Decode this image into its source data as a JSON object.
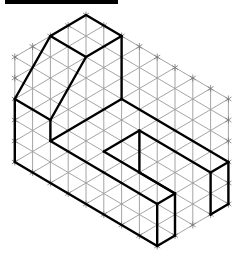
{
  "diagram": {
    "type": "isometric-drawing",
    "title_bar": {
      "color": "#000000"
    },
    "grid": {
      "origin_px": [
        86,
        15
      ],
      "step_x": 17.8,
      "step_y": 10.5,
      "color": "#9a9a9a",
      "boundary": [
        [
          0,
          0
        ],
        [
          8,
          8
        ],
        [
          8,
          18
        ],
        [
          4,
          22
        ],
        [
          -4,
          14
        ],
        [
          -4,
          4
        ]
      ]
    },
    "shape": {
      "color": "#000000",
      "edges": [
        [
          [
            0,
            0
          ],
          [
            2,
            2
          ]
        ],
        [
          [
            0,
            0
          ],
          [
            -2,
            2
          ]
        ],
        [
          [
            -2,
            2
          ],
          [
            0,
            4
          ]
        ],
        [
          [
            0,
            4
          ],
          [
            2,
            2
          ]
        ],
        [
          [
            -2,
            2
          ],
          [
            -4,
            8
          ]
        ],
        [
          [
            0,
            4
          ],
          [
            -2,
            10
          ]
        ],
        [
          [
            -4,
            8
          ],
          [
            -2,
            10
          ]
        ],
        [
          [
            -4,
            8
          ],
          [
            -4,
            14
          ]
        ],
        [
          [
            -2,
            10
          ],
          [
            -2,
            12
          ]
        ],
        [
          [
            -2,
            12
          ],
          [
            2,
            8
          ]
        ],
        [
          [
            2,
            2
          ],
          [
            2,
            8
          ]
        ],
        [
          [
            2,
            8
          ],
          [
            8,
            14
          ]
        ],
        [
          [
            -2,
            12
          ],
          [
            4,
            18
          ]
        ],
        [
          [
            -4,
            14
          ],
          [
            4,
            22
          ]
        ],
        [
          [
            4,
            18
          ],
          [
            4,
            22
          ]
        ],
        [
          [
            4,
            18
          ],
          [
            5,
            17
          ]
        ],
        [
          [
            4,
            22
          ],
          [
            5,
            21
          ]
        ],
        [
          [
            5,
            17
          ],
          [
            5,
            21
          ]
        ],
        [
          [
            1,
            13
          ],
          [
            3,
            11
          ]
        ],
        [
          [
            1,
            13
          ],
          [
            5,
            17
          ]
        ],
        [
          [
            3,
            11
          ],
          [
            3,
            15
          ]
        ],
        [
          [
            3,
            15
          ],
          [
            5,
            17
          ]
        ],
        [
          [
            3,
            11
          ],
          [
            7,
            15
          ]
        ],
        [
          [
            7,
            15
          ],
          [
            8,
            14
          ]
        ],
        [
          [
            7,
            15
          ],
          [
            7,
            19
          ]
        ],
        [
          [
            8,
            14
          ],
          [
            8,
            18
          ]
        ],
        [
          [
            7,
            19
          ],
          [
            8,
            18
          ]
        ]
      ]
    }
  }
}
